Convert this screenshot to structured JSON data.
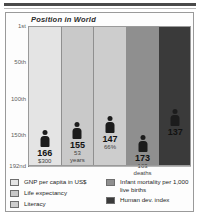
{
  "chart_data": {
    "type": "bar",
    "title": "Position in World",
    "xlabel": "",
    "ylabel": "Position in World",
    "ylim": [
      1,
      192
    ],
    "y_inverted": true,
    "grid": true,
    "ytick_labels": [
      "1st",
      "50th",
      "100th",
      "150th",
      "192nd"
    ],
    "ytick_values": [
      1,
      50,
      100,
      150,
      192
    ],
    "legend_position": "bottom",
    "categories": [
      "GNP per capita in US$",
      "Life expectancy",
      "Literacy",
      "Infant mortality per 1,000 live births",
      "Human dev. index"
    ],
    "values": [
      166,
      155,
      147,
      173,
      137
    ],
    "data_labels": [
      "166",
      "155",
      "147",
      "173",
      "137"
    ],
    "annotations": [
      "$300",
      "53 years",
      "66%",
      "103 deaths",
      ""
    ],
    "colors": [
      "#e4e4e4",
      "#c9c9c9",
      "#cdcdcd",
      "#8f8f8f",
      "#3a3a3a"
    ]
  },
  "chart": {
    "title": "Position in World",
    "axis": {
      "ticks": [
        {
          "label": "1st",
          "value": 1
        },
        {
          "label": "50th",
          "value": 50
        },
        {
          "label": "100th",
          "value": 100
        },
        {
          "label": "150th",
          "value": 150
        },
        {
          "label": "192nd",
          "value": 192
        }
      ]
    },
    "bars": [
      {
        "rank": "166",
        "detail": "$300",
        "detail2": "",
        "value": 166,
        "fill": "#e4e4e4"
      },
      {
        "rank": "155",
        "detail": "53",
        "detail2": "years",
        "value": 155,
        "fill": "#c9c9c9"
      },
      {
        "rank": "147",
        "detail": "66%",
        "detail2": "",
        "value": 147,
        "fill": "#cdcdcd"
      },
      {
        "rank": "173",
        "detail": "103",
        "detail2": "deaths",
        "value": 173,
        "fill": "#8f8f8f"
      },
      {
        "rank": "137",
        "detail": "",
        "detail2": "",
        "value": 137,
        "fill": "#3a3a3a"
      }
    ]
  },
  "legend": {
    "left": [
      {
        "label": "GNP per capita in US$",
        "color": "#e4e4e4"
      },
      {
        "label": "Life expectancy",
        "color": "#c9c9c9"
      },
      {
        "label": "Literacy",
        "color": "#cdcdcd"
      }
    ],
    "right": [
      {
        "label": "Infant mortality per 1,000 live births",
        "color": "#8f8f8f"
      },
      {
        "label": "Human dev. index",
        "color": "#3a3a3a"
      }
    ]
  }
}
